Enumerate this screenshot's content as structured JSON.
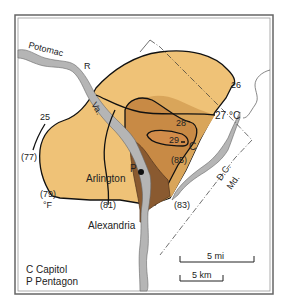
{
  "map": {
    "title": "Washington D.C. urban heat island",
    "colors": {
      "zone_25_27": "#efc277",
      "zone_27_28": "#d9a55a",
      "zone_28_29": "#c88a45",
      "zone_29_plus": "#d28c4a",
      "core_dark": "#8a5a30",
      "river": "#b5b5b5",
      "isotherm": "#111111",
      "frame": "#555555"
    },
    "labels": {
      "river_name": "Potomac",
      "river_suffix": "R",
      "state_va": "Va.",
      "state_dc": "D.C.",
      "state_md": "Md.",
      "city_arlington": "Arlington",
      "city_alexandria": "Alexandria",
      "point_p": "P",
      "point_c": "C"
    },
    "isotherms_celsius": [
      {
        "value": "25",
        "label": "25"
      },
      {
        "value": "26",
        "label": "26"
      },
      {
        "value": "27",
        "label": "27 °C"
      },
      {
        "value": "28",
        "label": "28"
      },
      {
        "value": "29",
        "label": "29"
      }
    ],
    "isotherms_fahrenheit": [
      {
        "value": "77",
        "label": "(77)"
      },
      {
        "value": "79",
        "label": "(79)"
      },
      {
        "value": "81",
        "label": "(81)"
      },
      {
        "value": "83",
        "label": "(83)"
      },
      {
        "value": "85",
        "label": "(85)"
      }
    ],
    "fahrenheit_unit": "°F",
    "legend": {
      "items": [
        {
          "symbol": "C",
          "label": "Capitol"
        },
        {
          "symbol": "P",
          "label": "Pentagon"
        }
      ]
    },
    "scale": {
      "miles": "5 mi",
      "km": "5 km"
    }
  }
}
